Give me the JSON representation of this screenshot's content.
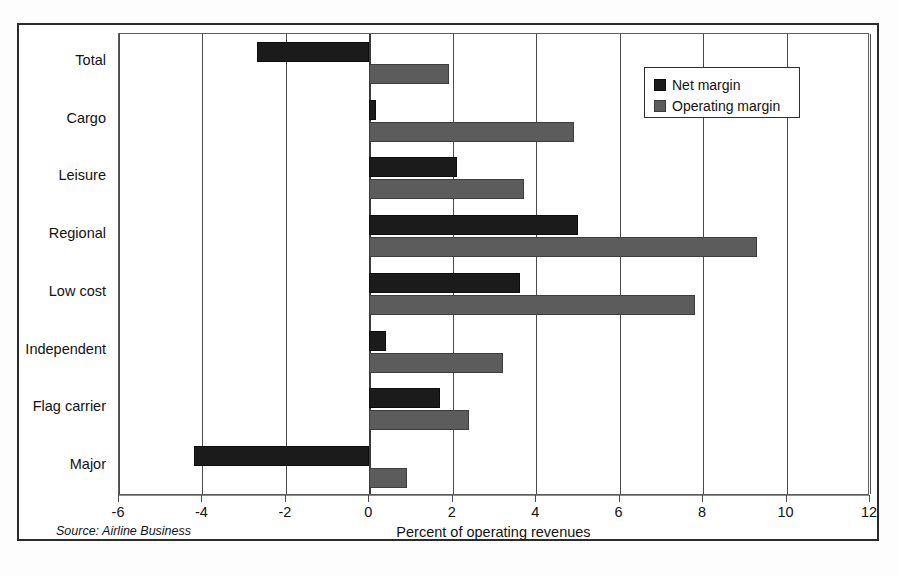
{
  "chart_data": {
    "type": "bar",
    "orientation": "horizontal",
    "title": "",
    "xlabel": "Percent of operating revenues",
    "ylabel": "",
    "xlim": [
      -6,
      12
    ],
    "xticks": [
      -6,
      -4,
      -2,
      0,
      2,
      4,
      6,
      8,
      10,
      12
    ],
    "xtick_labels": [
      "-6",
      "-4",
      "-2",
      "0",
      "2",
      "4",
      "6",
      "8",
      "10",
      "12"
    ],
    "grid": true,
    "legend_position": "top-right",
    "categories": [
      "Total",
      "Cargo",
      "Leisure",
      "Regional",
      "Low cost",
      "Independent",
      "Flag carrier",
      "Major"
    ],
    "series": [
      {
        "name": "Net margin",
        "color": "#1b1b1b",
        "values": [
          -2.7,
          0.15,
          2.1,
          5.0,
          3.6,
          0.4,
          1.7,
          -4.2
        ]
      },
      {
        "name": "Operating margin",
        "color": "#5c5c5c",
        "values": [
          1.9,
          4.9,
          3.7,
          9.3,
          7.8,
          3.2,
          2.4,
          0.9
        ]
      }
    ],
    "annotations": {
      "source": "Source: Airline Business"
    }
  },
  "legend": {
    "items": [
      {
        "label": "Net margin",
        "color": "#1b1b1b"
      },
      {
        "label": "Operating margin",
        "color": "#5c5c5c"
      }
    ]
  },
  "colors": {
    "net_margin": "#1b1b1b",
    "operating_margin": "#5c5c5c",
    "frame": "#2b2b2b",
    "gridline": "#4a4a4a",
    "background": "#ffffff"
  }
}
